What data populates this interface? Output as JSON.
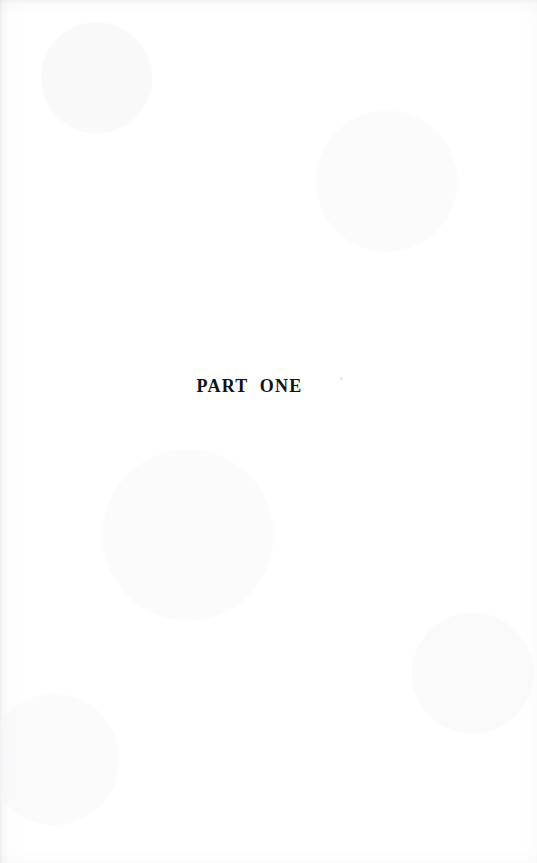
{
  "document": {
    "type": "scanned-book-page",
    "page_background": "#ffffff",
    "ink_color": "#121212"
  },
  "content": {
    "part_title": "PART  ONE"
  },
  "artifacts": {
    "dust_speck": "scan-dust-speck",
    "edge_shading": "scanner-edge-shadow",
    "paper_grain": "paper-grain"
  }
}
